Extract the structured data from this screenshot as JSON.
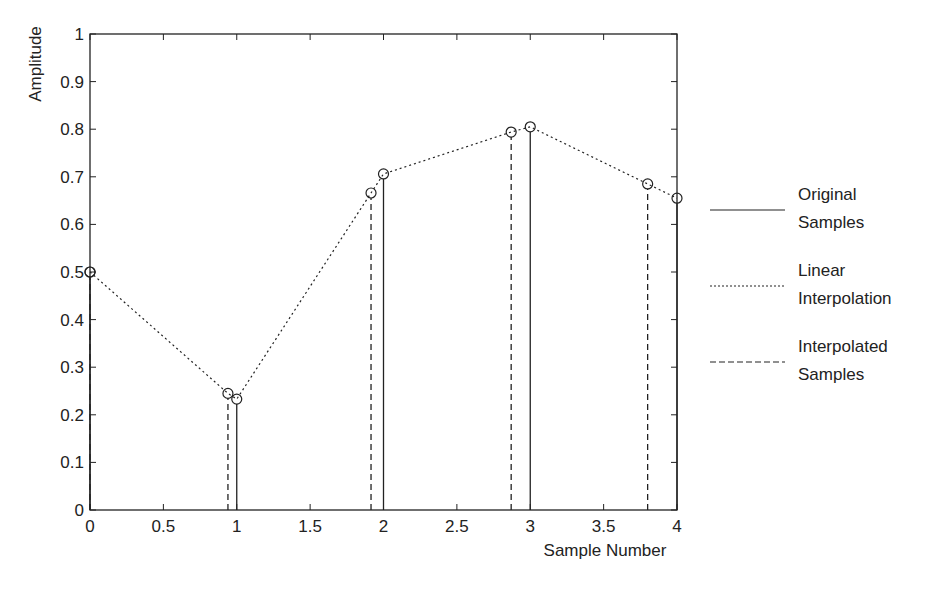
{
  "chart_data": {
    "type": "line",
    "title": "",
    "xlabel": "Sample Number",
    "ylabel": "Amplitude",
    "xlim": [
      0,
      4
    ],
    "ylim": [
      0,
      1
    ],
    "grid": false,
    "legend_position": "right",
    "x_ticks": [
      "0",
      "0.5",
      "1",
      "1.5",
      "2",
      "2.5",
      "3",
      "3.5",
      "4"
    ],
    "y_ticks": [
      "0",
      "0.1",
      "0.2",
      "0.3",
      "0.4",
      "0.5",
      "0.6",
      "0.7",
      "0.8",
      "0.9",
      "1"
    ],
    "series": [
      {
        "name": "Original Samples",
        "style": "solid-stem",
        "x": [
          0,
          1,
          2,
          3,
          4
        ],
        "values": [
          0.5,
          0.233,
          0.706,
          0.805,
          0.655
        ]
      },
      {
        "name": "Linear Interpolation",
        "style": "dotted-line",
        "x": [
          0,
          0.94,
          1,
          1.915,
          2,
          2.87,
          3,
          3.8,
          4
        ],
        "values": [
          0.5,
          0.245,
          0.233,
          0.666,
          0.706,
          0.794,
          0.805,
          0.685,
          0.655
        ]
      },
      {
        "name": "Interpolated Samples",
        "style": "dashed-stem",
        "x": [
          0,
          0.94,
          1.915,
          2.87,
          3.8
        ],
        "values": [
          0.5,
          0.245,
          0.666,
          0.794,
          0.685
        ]
      }
    ],
    "legend": [
      {
        "line1": "Original",
        "line2": "Samples",
        "style": "solid"
      },
      {
        "line1": "Linear",
        "line2": "Interpolation",
        "style": "dotted"
      },
      {
        "line1": "Interpolated",
        "line2": "Samples",
        "style": "dashed"
      }
    ]
  }
}
